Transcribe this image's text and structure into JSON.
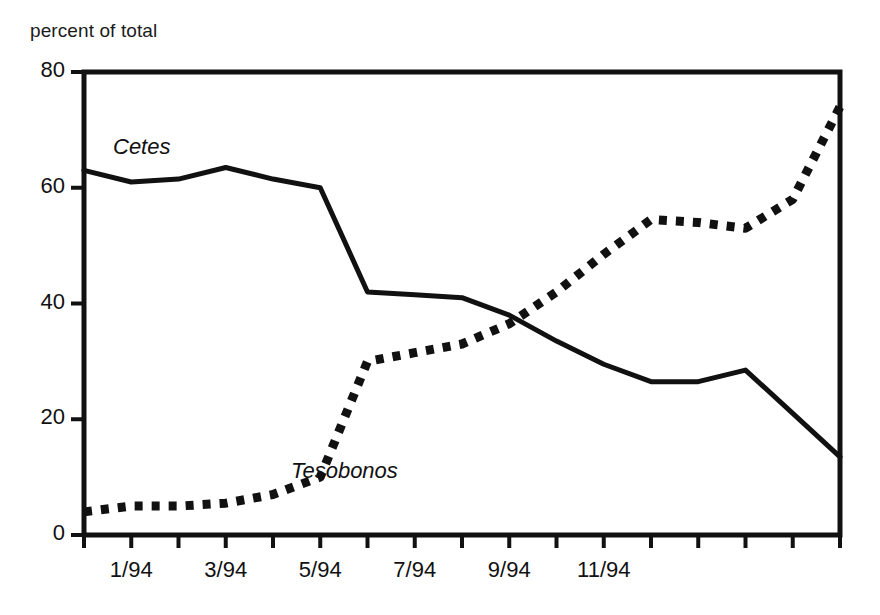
{
  "figure": {
    "y_axis_title": "percent of total",
    "background_color": "#ffffff",
    "line_color": "#111111"
  },
  "axes": {
    "y_ticks": [
      "0",
      "20",
      "40",
      "60",
      "80"
    ],
    "y_tick_values": [
      0,
      20,
      40,
      60,
      80
    ],
    "x_ticks": [
      "1/94",
      "3/94",
      "5/94",
      "7/94",
      "9/94",
      "11/94"
    ],
    "x_tick_index": [
      1,
      3,
      5,
      7,
      9,
      11
    ]
  },
  "series_labels": {
    "cetes": "Cetes",
    "tesobonos": "Tesobonos"
  },
  "chart_data": {
    "type": "line",
    "title": "",
    "subtitle": "",
    "xlabel": "",
    "ylabel": "percent of total",
    "ylim": [
      0,
      80
    ],
    "xlim": [
      0,
      16
    ],
    "grid": false,
    "legend": "inline-annotation",
    "x": [
      0,
      1,
      2,
      3,
      4,
      5,
      6,
      7,
      8,
      9,
      10,
      11,
      12,
      13,
      14,
      15,
      16
    ],
    "x_tick_labels": [
      "",
      "1/94",
      "",
      "3/94",
      "",
      "5/94",
      "",
      "7/94",
      "",
      "9/94",
      "",
      "11/94",
      ""
    ],
    "series": [
      {
        "name": "Cetes",
        "style": "solid",
        "color": "#111111",
        "values": [
          63,
          61,
          61.5,
          63.5,
          61.5,
          60,
          42,
          41.5,
          41,
          38,
          33.5,
          29.5,
          26.5,
          26.5,
          28.5,
          21,
          13.5
        ]
      },
      {
        "name": "Tesobonos",
        "style": "dotted",
        "color": "#111111",
        "values": [
          4,
          5,
          5,
          5.5,
          7,
          10,
          30,
          31.5,
          33,
          36.5,
          42,
          48.5,
          54.5,
          54,
          53,
          58,
          74
        ]
      }
    ],
    "annotations": [
      {
        "text": "Cetes",
        "x": 0.55,
        "y": 69
      },
      {
        "text": "Tesobonos",
        "x": 3.9,
        "y": 11
      }
    ]
  }
}
